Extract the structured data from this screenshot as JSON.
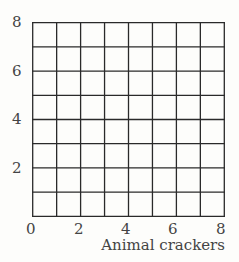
{
  "chart_data": {
    "type": "scatter",
    "title": "",
    "xlabel": "Animal crackers",
    "ylabel": "",
    "xlim": [
      0,
      8
    ],
    "ylim": [
      0,
      8
    ],
    "grid": true,
    "grid_step": 1,
    "x_ticks": [
      "0",
      "2",
      "4",
      "6",
      "8"
    ],
    "y_ticks": [
      "2",
      "4",
      "6",
      "8"
    ],
    "series": []
  }
}
